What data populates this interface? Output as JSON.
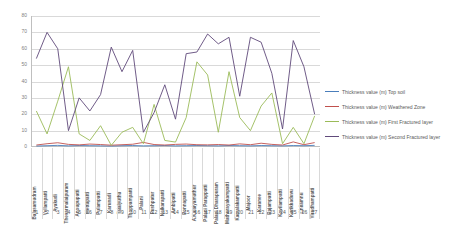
{
  "chart_data": {
    "type": "line",
    "title": "",
    "xlabel": "",
    "ylabel": "",
    "ylim": [
      0,
      80
    ],
    "ytick_step": 10,
    "grid": true,
    "legend_position": "right",
    "yticks": [
      "0",
      "10",
      "20",
      "30",
      "40",
      "50",
      "60",
      "70",
      "80"
    ],
    "x_numbers": [
      "1",
      "2",
      "3",
      "4",
      "5",
      "6",
      "7",
      "8",
      "9",
      "10",
      "11",
      "12",
      "13",
      "14",
      "15",
      "16",
      "17",
      "18",
      "19",
      "20",
      "21",
      "22",
      "23",
      "24",
      "25",
      "26",
      "27"
    ],
    "categories": [
      "Balasamudram",
      "Vellampatti",
      "Ayakudi",
      "Thevarmalaipuram",
      "Anoupupatti",
      "Mettupatti",
      "Pulampatti",
      "Karunadi",
      "Talaiyuthu",
      "Thoppampatti",
      "Palani",
      "Pushpatur",
      "Neikarapatti",
      "Ambipatti",
      "Ponnapatti",
      "A.Kalaiyamuthur",
      "Palani Parappatti",
      "Palani Dharapuram",
      "Mathurayakampatti",
      "Kamalakampatti",
      "Majoor",
      "Karanee",
      "Rajampatti",
      "Kovilampatti",
      "Kurikkaduvu",
      "Chilamnu",
      "Virudhampatti"
    ],
    "series": [
      {
        "name": "Thickness value (m) Top soil",
        "color": "#4a7ebb",
        "values": [
          0.6,
          0.8,
          1.0,
          0.7,
          0.9,
          0.8,
          0.7,
          0.6,
          0.8,
          0.9,
          0.7,
          0.8,
          0.9,
          0.7,
          0.8,
          0.9,
          0.8,
          0.7,
          0.9,
          0.8,
          0.7,
          0.9,
          0.8,
          0.7,
          0.9,
          0.8,
          1.0
        ]
      },
      {
        "name": "Thickness value (m) Weathered Zone",
        "color": "#c0504d",
        "values": [
          1.2,
          2.0,
          2.6,
          1.6,
          1.3,
          1.8,
          1.5,
          1.1,
          1.4,
          1.7,
          2.8,
          1.5,
          1.2,
          1.6,
          1.8,
          1.4,
          1.3,
          1.5,
          1.2,
          1.9,
          1.4,
          2.3,
          1.6,
          1.2,
          3.1,
          1.4,
          2.7
        ]
      },
      {
        "name": "Thickness value (m) First Fractured  layer",
        "color": "#9bbb59",
        "values": [
          22,
          8,
          28,
          49,
          8,
          4,
          13,
          1,
          9,
          12,
          2,
          26,
          4,
          3,
          18,
          52,
          44,
          9,
          46,
          18,
          10,
          25,
          33,
          2,
          12,
          2,
          19
        ]
      },
      {
        "name": "Thickness value (m) Second Fractured layer",
        "color": "#604a7b",
        "values": [
          54,
          70,
          60,
          10,
          30,
          22,
          32,
          61,
          46,
          59,
          9,
          21,
          38,
          17,
          57,
          58,
          69,
          63,
          67,
          31,
          67,
          64,
          45,
          11,
          65,
          49,
          20
        ]
      }
    ]
  },
  "legend": {
    "items": [
      {
        "label": "Thickness value (m) Top soil",
        "color": "#4a7ebb"
      },
      {
        "label": "Thickness value (m) Weathered Zone",
        "color": "#c0504d"
      },
      {
        "label": "Thickness value (m) First Fractured  layer",
        "color": "#9bbb59"
      },
      {
        "label": "Thickness value (m) Second Fractured layer",
        "color": "#604a7b"
      }
    ]
  }
}
